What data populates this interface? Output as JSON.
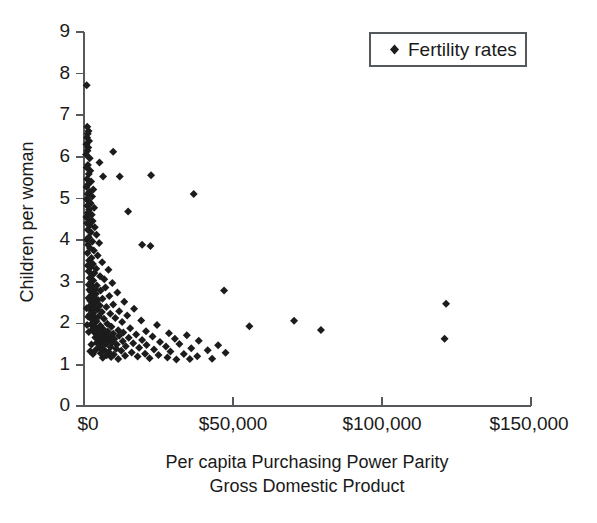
{
  "chart_data": {
    "type": "scatter",
    "title": "",
    "xlabel": "Per capita Purchasing Power Parity Gross Domestic Product",
    "xlabel_lines": [
      "Per capita Purchasing Power Parity",
      "Gross Domestic Product"
    ],
    "ylabel": "Children per woman",
    "xlim": [
      0,
      150000
    ],
    "ylim": [
      0,
      9
    ],
    "xticks": [
      0,
      50000,
      100000,
      150000
    ],
    "xtick_labels": [
      "$0",
      "$50,000",
      "$100,000",
      "$150,000"
    ],
    "yticks": [
      0,
      1,
      2,
      3,
      4,
      5,
      6,
      7,
      8,
      9
    ],
    "ytick_labels": [
      "0",
      "1",
      "2",
      "3",
      "4",
      "5",
      "6",
      "7",
      "8",
      "9"
    ],
    "grid": false,
    "legend_position": "top-right",
    "marker_shape": "diamond",
    "marker_color": "#1c1c1c",
    "series": [
      {
        "name": "Fertility rates",
        "points": [
          [
            900,
            7.72
          ],
          [
            1100,
            6.72
          ],
          [
            1500,
            6.62
          ],
          [
            1250,
            6.55
          ],
          [
            1000,
            6.46
          ],
          [
            1700,
            6.38
          ],
          [
            800,
            6.3
          ],
          [
            1400,
            6.22
          ],
          [
            1150,
            6.14
          ],
          [
            9800,
            6.12
          ],
          [
            700,
            6.05
          ],
          [
            1900,
            5.96
          ],
          [
            5200,
            5.86
          ],
          [
            1300,
            5.8
          ],
          [
            900,
            5.74
          ],
          [
            2100,
            5.66
          ],
          [
            1600,
            5.58
          ],
          [
            6400,
            5.52
          ],
          [
            22500,
            5.55
          ],
          [
            1050,
            5.46
          ],
          [
            2400,
            5.4
          ],
          [
            1350,
            5.33
          ],
          [
            850,
            5.27
          ],
          [
            3100,
            5.21
          ],
          [
            1800,
            5.15
          ],
          [
            1200,
            5.1
          ],
          [
            36800,
            5.1
          ],
          [
            2700,
            5.04
          ],
          [
            950,
            4.98
          ],
          [
            1550,
            4.93
          ],
          [
            2200,
            4.88
          ],
          [
            1100,
            4.82
          ],
          [
            3400,
            4.77
          ],
          [
            1700,
            4.72
          ],
          [
            14800,
            4.68
          ],
          [
            1300,
            4.65
          ],
          [
            2600,
            4.6
          ],
          [
            800,
            4.55
          ],
          [
            1450,
            4.5
          ],
          [
            2900,
            4.45
          ],
          [
            1000,
            4.4
          ],
          [
            1900,
            4.35
          ],
          [
            3600,
            4.3
          ],
          [
            1250,
            4.24
          ],
          [
            2300,
            4.18
          ],
          [
            4200,
            4.12
          ],
          [
            1600,
            4.06
          ],
          [
            900,
            4.0
          ],
          [
            2800,
            3.96
          ],
          [
            5100,
            3.92
          ],
          [
            1350,
            3.88
          ],
          [
            22300,
            3.85
          ],
          [
            2000,
            3.8
          ],
          [
            3300,
            3.74
          ],
          [
            1150,
            3.68
          ],
          [
            4600,
            3.62
          ],
          [
            2500,
            3.56
          ],
          [
            1700,
            3.5
          ],
          [
            6100,
            3.46
          ],
          [
            3000,
            3.42
          ],
          [
            1250,
            3.38
          ],
          [
            2200,
            3.34
          ],
          [
            4100,
            3.3
          ],
          [
            8200,
            3.28
          ],
          [
            1500,
            3.24
          ],
          [
            3500,
            3.2
          ],
          [
            2700,
            3.16
          ],
          [
            5400,
            3.12
          ],
          [
            1900,
            3.08
          ],
          [
            6800,
            3.05
          ],
          [
            3100,
            3.02
          ],
          [
            2400,
            2.98
          ],
          [
            9500,
            2.96
          ],
          [
            1600,
            2.92
          ],
          [
            4300,
            2.9
          ],
          [
            2900,
            2.87
          ],
          [
            7200,
            2.85
          ],
          [
            3700,
            2.82
          ],
          [
            1800,
            2.8
          ],
          [
            5600,
            2.78
          ],
          [
            2300,
            2.75
          ],
          [
            11200,
            2.73
          ],
          [
            4000,
            2.7
          ],
          [
            2600,
            2.67
          ],
          [
            8500,
            2.65
          ],
          [
            3300,
            2.62
          ],
          [
            1500,
            2.6
          ],
          [
            6200,
            2.58
          ],
          [
            4700,
            2.55
          ],
          [
            2100,
            2.53
          ],
          [
            13500,
            2.51
          ],
          [
            3800,
            2.49
          ],
          [
            2800,
            2.46
          ],
          [
            9800,
            2.44
          ],
          [
            5300,
            2.42
          ],
          [
            1900,
            2.4
          ],
          [
            7500,
            2.38
          ],
          [
            3500,
            2.36
          ],
          [
            16800,
            2.34
          ],
          [
            4400,
            2.32
          ],
          [
            2400,
            2.3
          ],
          [
            11800,
            2.28
          ],
          [
            6000,
            2.26
          ],
          [
            3100,
            2.24
          ],
          [
            8800,
            2.22
          ],
          [
            2000,
            2.2
          ],
          [
            14500,
            2.18
          ],
          [
            5000,
            2.16
          ],
          [
            3600,
            2.14
          ],
          [
            10500,
            2.12
          ],
          [
            6700,
            2.1
          ],
          [
            2700,
            2.08
          ],
          [
            19200,
            2.06
          ],
          [
            4200,
            2.04
          ],
          [
            70500,
            2.05
          ],
          [
            12800,
            2.02
          ],
          [
            3300,
            2.0
          ],
          [
            7800,
            1.98
          ],
          [
            2300,
            1.96
          ],
          [
            24500,
            1.95
          ],
          [
            5500,
            1.93
          ],
          [
            9200,
            1.91
          ],
          [
            3900,
            1.89
          ],
          [
            15500,
            1.87
          ],
          [
            6400,
            1.85
          ],
          [
            2800,
            1.84
          ],
          [
            79500,
            1.83
          ],
          [
            11500,
            1.82
          ],
          [
            4600,
            1.81
          ],
          [
            20800,
            1.8
          ],
          [
            8000,
            1.79
          ],
          [
            3400,
            1.78
          ],
          [
            13200,
            1.77
          ],
          [
            5800,
            1.76
          ],
          [
            28500,
            1.75
          ],
          [
            9800,
            1.74
          ],
          [
            4100,
            1.73
          ],
          [
            17500,
            1.72
          ],
          [
            7200,
            1.71
          ],
          [
            34500,
            1.7
          ],
          [
            11800,
            1.69
          ],
          [
            5200,
            1.68
          ],
          [
            23000,
            1.67
          ],
          [
            8600,
            1.66
          ],
          [
            3800,
            1.65
          ],
          [
            15000,
            1.64
          ],
          [
            6600,
            1.63
          ],
          [
            30500,
            1.62
          ],
          [
            121000,
            1.62
          ],
          [
            10200,
            1.61
          ],
          [
            4700,
            1.6
          ],
          [
            19500,
            1.59
          ],
          [
            8100,
            1.58
          ],
          [
            38500,
            1.57
          ],
          [
            13000,
            1.56
          ],
          [
            5900,
            1.55
          ],
          [
            25500,
            1.54
          ],
          [
            9500,
            1.53
          ],
          [
            4300,
            1.52
          ],
          [
            16500,
            1.51
          ],
          [
            7400,
            1.5
          ],
          [
            32000,
            1.49
          ],
          [
            11000,
            1.48
          ],
          [
            21000,
            1.47
          ],
          [
            45000,
            1.46
          ],
          [
            6100,
            1.45
          ],
          [
            14000,
            1.44
          ],
          [
            27500,
            1.43
          ],
          [
            8900,
            1.42
          ],
          [
            5100,
            1.41
          ],
          [
            18500,
            1.4
          ],
          [
            36000,
            1.39
          ],
          [
            10800,
            1.38
          ],
          [
            23500,
            1.36
          ],
          [
            6800,
            1.35
          ],
          [
            41500,
            1.34
          ],
          [
            12500,
            1.33
          ],
          [
            29000,
            1.31
          ],
          [
            8300,
            1.3
          ],
          [
            16000,
            1.29
          ],
          [
            47500,
            1.28
          ],
          [
            5600,
            1.27
          ],
          [
            20500,
            1.26
          ],
          [
            33500,
            1.25
          ],
          [
            10000,
            1.24
          ],
          [
            25000,
            1.23
          ],
          [
            7600,
            1.22
          ],
          [
            13800,
            1.21
          ],
          [
            38000,
            1.2
          ],
          [
            18000,
            1.19
          ],
          [
            9100,
            1.18
          ],
          [
            28000,
            1.17
          ],
          [
            6300,
            1.16
          ],
          [
            22000,
            1.15
          ],
          [
            43000,
            1.14
          ],
          [
            11500,
            1.13
          ],
          [
            31000,
            1.12
          ],
          [
            35500,
            1.13
          ],
          [
            121500,
            2.46
          ],
          [
            1050,
            1.95
          ],
          [
            1400,
            2.15
          ],
          [
            900,
            2.35
          ],
          [
            1600,
            1.78
          ],
          [
            2100,
            1.32
          ],
          [
            2500,
            1.48
          ],
          [
            3000,
            1.25
          ],
          [
            3900,
            1.35
          ],
          [
            12000,
            5.52
          ],
          [
            19500,
            3.88
          ],
          [
            47000,
            2.78
          ],
          [
            55500,
            1.92
          ]
        ]
      }
    ]
  },
  "legend": {
    "entries": [
      {
        "label": "Fertility rates",
        "marker": "diamond-marker"
      }
    ]
  }
}
